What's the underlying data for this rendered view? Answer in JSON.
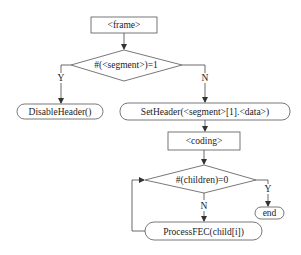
{
  "diagram": {
    "type": "flowchart",
    "nodes": {
      "frame": "<frame>",
      "decision1": "#(<segment>)=1",
      "disable_header": "DisableHeader()",
      "set_header": "SetHeader(<segment>[1].<data>)",
      "coding": "<coding>",
      "decision2": "#(children)=0",
      "end": "end",
      "process_fec": "ProcessFEC(child[i])"
    },
    "edge_labels": {
      "d1_yes": "Y",
      "d1_no": "N",
      "d2_yes": "Y",
      "d2_no": "N"
    },
    "colors": {
      "stroke": "#555555",
      "text": "#222222",
      "background": "#ffffff"
    }
  }
}
